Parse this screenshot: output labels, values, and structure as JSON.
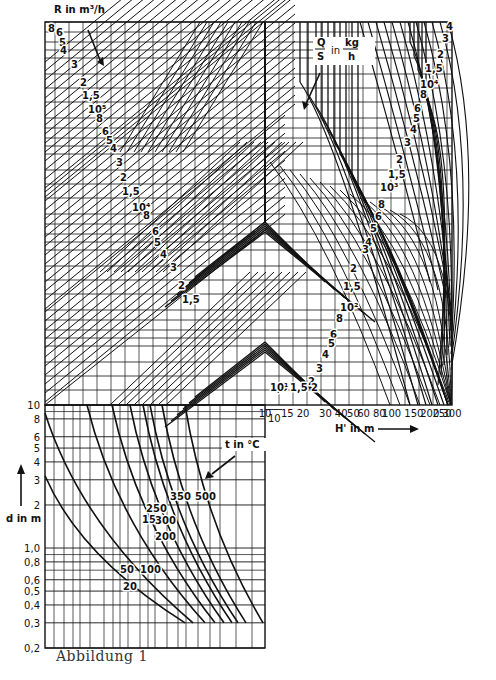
{
  "chart_data": {
    "type": "nomogram",
    "title": "",
    "caption": "Abbildung 1",
    "upper_chart": {
      "r_label": "R in m³/h",
      "q_label_num": "Q",
      "q_label_den": "S",
      "q_label_in": "in",
      "q_label_unit_num": "kg",
      "q_label_unit_den": "h",
      "xlabel": "H' in m",
      "x_ticks": [
        "10",
        "15",
        "20",
        "30",
        "40",
        "50",
        "60",
        "80",
        "100",
        "150",
        "200",
        "250",
        "300"
      ],
      "x_tick_values": [
        10,
        15,
        20,
        30,
        40,
        50,
        60,
        80,
        100,
        150,
        200,
        250,
        300
      ],
      "xscale": "log",
      "xlim": [
        10,
        300
      ],
      "r_families_left": [
        {
          "decade": "10^6",
          "labels": [
            "8",
            "6",
            "5",
            "4",
            "3",
            "2",
            "1,5"
          ]
        },
        {
          "decade": "10^5",
          "labels": [
            "10⁵",
            "8",
            "6",
            "5",
            "4",
            "3",
            "2",
            "1,5"
          ]
        },
        {
          "decade": "10^4",
          "labels": [
            "10⁴",
            "8",
            "6",
            "5",
            "4",
            "3",
            "2",
            "1,5"
          ]
        }
      ],
      "q_families_right": [
        {
          "decade": "10^4",
          "labels": [
            "4",
            "3",
            "2",
            "1,5",
            "10⁴",
            "8",
            "6",
            "5",
            "4",
            "3",
            "2",
            "1,5"
          ]
        },
        {
          "decade": "10^3",
          "labels": [
            "10³",
            "8",
            "6",
            "5",
            "4",
            "3",
            "2",
            "1,5"
          ]
        },
        {
          "decade": "10^2",
          "labels": [
            "10²",
            "8",
            "6",
            "5",
            "4",
            "3",
            "2",
            "1,5"
          ]
        },
        {
          "decade": "10^1",
          "labels": [
            "10¹",
            "1,5",
            "2"
          ]
        }
      ]
    },
    "lower_chart": {
      "ylabel": "d in m",
      "y_ticks": [
        "10",
        "8",
        "6",
        "5",
        "4",
        "3",
        "2",
        "1,0",
        "0,8",
        "0,6",
        "0,5",
        "0,4",
        "0,3",
        "0,2"
      ],
      "y_tick_values": [
        10,
        8,
        6,
        5,
        4,
        3,
        2,
        1.0,
        0.8,
        0.6,
        0.5,
        0.4,
        0.3,
        0.2
      ],
      "yscale": "log",
      "ylim": [
        0.2,
        10
      ],
      "right_tick": "10",
      "legend_title": "t in °C",
      "series": [
        {
          "name": "20",
          "label": "20"
        },
        {
          "name": "50",
          "label": "50"
        },
        {
          "name": "100",
          "label": "100"
        },
        {
          "name": "150",
          "label": "150"
        },
        {
          "name": "200",
          "label": "200"
        },
        {
          "name": "250",
          "label": "250"
        },
        {
          "name": "300",
          "label": "300"
        },
        {
          "name": "350",
          "label": "350"
        },
        {
          "name": "500",
          "label": "500"
        }
      ]
    },
    "grid": true
  }
}
